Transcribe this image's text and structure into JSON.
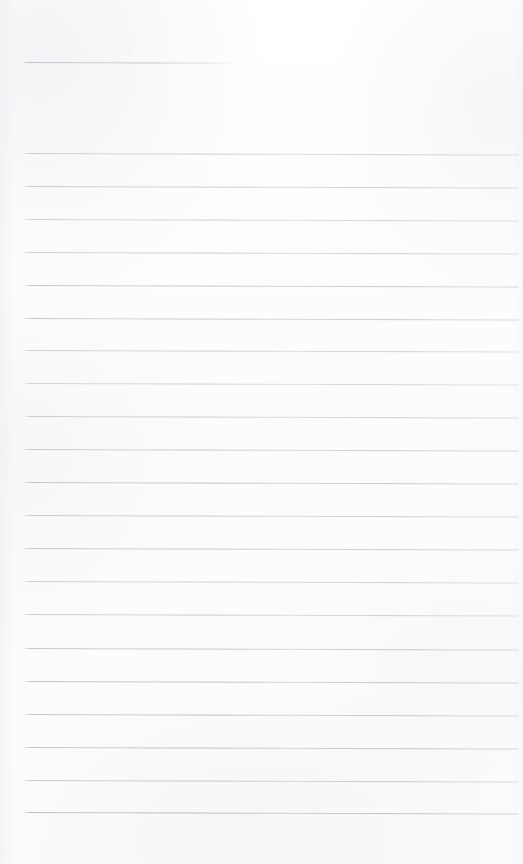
{
  "document": {
    "kind": "scanned-lined-paper",
    "title": "",
    "body_text": "",
    "page_width": 523,
    "page_height": 864,
    "orientation": "portrait",
    "has_handwriting": false,
    "has_printed_text": false,
    "content_note": ""
  },
  "colors": {
    "paper_background": "#fdfdfd",
    "page_white": "#ffffff",
    "rule_line": "#b8bcc0",
    "rule_line_dark": "#969aa0",
    "scan_shadow": "#eceef1"
  },
  "ruling": {
    "line_count": 22,
    "full_line_count": 21,
    "partial_line_count": 1,
    "left_margin_x": 23,
    "right_edge_x": 518,
    "line_spacing_px": 32.6,
    "line_thickness_px": 1,
    "skew_degrees": 0.18,
    "first_line_y": 62,
    "last_line_y": 812
  },
  "lines": [
    {
      "id": "rule-01",
      "y": 62,
      "x": 23,
      "width": 214,
      "type": "partial",
      "opacity": 0.62
    },
    {
      "id": "rule-02",
      "y": 153,
      "x": 23,
      "width": 495,
      "type": "full",
      "opacity": 0.58
    },
    {
      "id": "rule-03",
      "y": 186,
      "x": 23,
      "width": 495,
      "type": "full",
      "opacity": 0.62
    },
    {
      "id": "rule-04",
      "y": 219,
      "x": 23,
      "width": 495,
      "type": "full",
      "opacity": 0.55
    },
    {
      "id": "rule-05",
      "y": 252,
      "x": 23,
      "width": 495,
      "type": "full",
      "opacity": 0.6
    },
    {
      "id": "rule-06",
      "y": 285,
      "x": 23,
      "width": 495,
      "type": "full",
      "opacity": 0.7
    },
    {
      "id": "rule-07",
      "y": 318,
      "x": 23,
      "width": 495,
      "type": "full",
      "opacity": 0.66
    },
    {
      "id": "rule-08",
      "y": 350,
      "x": 23,
      "width": 495,
      "type": "full",
      "opacity": 0.58
    },
    {
      "id": "rule-09",
      "y": 383,
      "x": 23,
      "width": 495,
      "type": "full",
      "opacity": 0.54
    },
    {
      "id": "rule-10",
      "y": 416,
      "x": 23,
      "width": 495,
      "type": "full",
      "opacity": 0.6
    },
    {
      "id": "rule-11",
      "y": 449,
      "x": 23,
      "width": 495,
      "type": "full",
      "opacity": 0.64
    },
    {
      "id": "rule-12",
      "y": 482,
      "x": 23,
      "width": 495,
      "type": "full",
      "opacity": 0.7
    },
    {
      "id": "rule-13",
      "y": 515,
      "x": 23,
      "width": 495,
      "type": "full",
      "opacity": 0.62
    },
    {
      "id": "rule-14",
      "y": 548,
      "x": 23,
      "width": 495,
      "type": "full",
      "opacity": 0.66
    },
    {
      "id": "rule-15",
      "y": 581,
      "x": 23,
      "width": 495,
      "type": "full",
      "opacity": 0.58
    },
    {
      "id": "rule-16",
      "y": 614,
      "x": 23,
      "width": 495,
      "type": "full",
      "opacity": 0.62
    },
    {
      "id": "rule-17",
      "y": 648,
      "x": 23,
      "width": 495,
      "type": "full",
      "opacity": 0.68
    },
    {
      "id": "rule-18",
      "y": 681,
      "x": 23,
      "width": 495,
      "type": "full",
      "opacity": 0.72
    },
    {
      "id": "rule-19",
      "y": 714,
      "x": 23,
      "width": 495,
      "type": "full",
      "opacity": 0.7
    },
    {
      "id": "rule-20",
      "y": 747,
      "x": 23,
      "width": 495,
      "type": "full",
      "opacity": 0.74
    },
    {
      "id": "rule-21",
      "y": 780,
      "x": 23,
      "width": 495,
      "type": "full",
      "opacity": 0.66
    },
    {
      "id": "rule-22",
      "y": 812,
      "x": 23,
      "width": 495,
      "type": "full",
      "opacity": 0.78
    }
  ]
}
